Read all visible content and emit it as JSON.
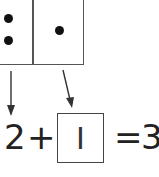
{
  "domino": {
    "left_half": {
      "dots": 2
    },
    "right_half": {
      "dots": 1
    }
  },
  "equation": {
    "addend1": "2",
    "plus": "+",
    "addend2": "I",
    "equals": "=",
    "sum": "3"
  }
}
